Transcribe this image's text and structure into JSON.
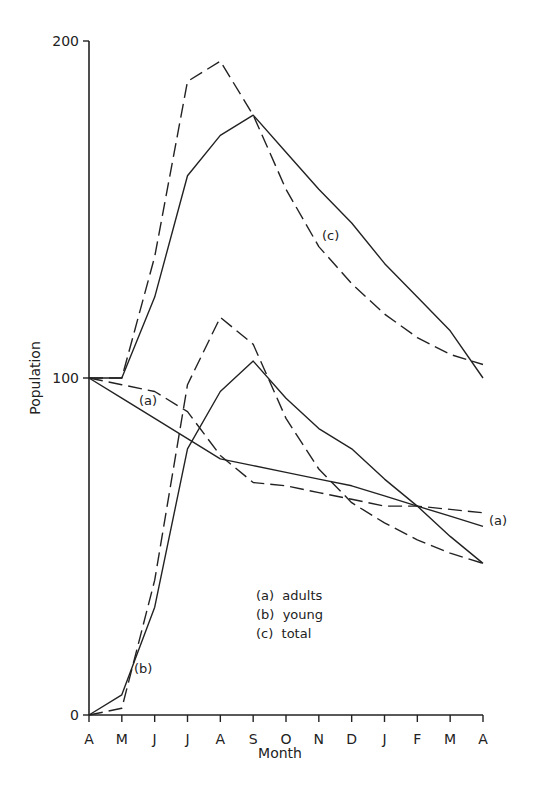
{
  "chart_data": {
    "type": "line",
    "title": "",
    "xlabel": "Month",
    "ylabel": "Population",
    "categories": [
      "A",
      "M",
      "J",
      "J",
      "A",
      "S",
      "O",
      "N",
      "D",
      "J",
      "F",
      "M",
      "A"
    ],
    "yticks": [
      0,
      100,
      200
    ],
    "ylim": [
      0,
      200
    ],
    "grid": false,
    "legend": {
      "position": "inside-lower-middle",
      "entries": [
        "(a)  adults",
        "(b)  young",
        "(c)  total"
      ]
    },
    "series": [
      {
        "name": "adults (solid)",
        "label": "(a)",
        "style": "solid",
        "values": [
          100,
          94,
          88,
          82,
          76,
          74,
          72,
          70,
          68,
          65,
          62,
          59,
          56
        ]
      },
      {
        "name": "adults (dashed)",
        "label": "(a)",
        "style": "dashed",
        "values": [
          100,
          98,
          96,
          90,
          77,
          69,
          68,
          66,
          64,
          62,
          62,
          61,
          60
        ]
      },
      {
        "name": "young (solid)",
        "label": "(b)",
        "style": "solid",
        "values": [
          0,
          6,
          32,
          79,
          96,
          105,
          94,
          85,
          79,
          70,
          62,
          53,
          45
        ]
      },
      {
        "name": "young (dashed)",
        "label": "(b)",
        "style": "dashed",
        "values": [
          0,
          2,
          40,
          98,
          118,
          110,
          88,
          73,
          63,
          57,
          52,
          48,
          45
        ]
      },
      {
        "name": "total (solid)",
        "label": "(c)",
        "style": "solid",
        "values": [
          100,
          100,
          124,
          160,
          172,
          178,
          167,
          156,
          146,
          134,
          124,
          114,
          100
        ]
      },
      {
        "name": "total (dashed)",
        "label": "(c)",
        "style": "dashed",
        "values": [
          100,
          100,
          136,
          188,
          194,
          178,
          156,
          139,
          128,
          119,
          112,
          107,
          104
        ]
      }
    ],
    "annotations": [
      {
        "text": "(a)",
        "near": "adults curves, between M and J"
      },
      {
        "text": "(a)",
        "near": "adults curves, right end"
      },
      {
        "text": "(b)",
        "near": "young curves, near J"
      },
      {
        "text": "(c)",
        "near": "total curves, near N"
      }
    ]
  }
}
